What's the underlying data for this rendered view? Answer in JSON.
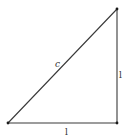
{
  "diagram": {
    "type": "right-triangle",
    "vertices": [
      {
        "id": "A",
        "x": 8,
        "y": 123
      },
      {
        "id": "B",
        "x": 117,
        "y": 9
      },
      {
        "id": "C",
        "x": 117,
        "y": 123
      }
    ],
    "edges": [
      {
        "from": "A",
        "to": "B",
        "role": "hypotenuse",
        "label": "c"
      },
      {
        "from": "B",
        "to": "C",
        "role": "vertical-leg",
        "label": "l"
      },
      {
        "from": "A",
        "to": "C",
        "role": "horizontal-leg",
        "label": "l"
      }
    ],
    "labels": {
      "hypotenuse": "c",
      "vertical_leg": "l",
      "horizontal_leg": "l"
    },
    "colors": {
      "line": "#3a3a3a",
      "vertex": "#1a1a1a",
      "text": "#333333",
      "background": "#ffffff"
    }
  }
}
